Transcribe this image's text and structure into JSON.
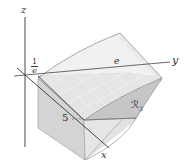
{
  "figure": {
    "type": "3d-region-diagram",
    "axes": {
      "z_label": "z",
      "y_label": "y",
      "x_label": "x"
    },
    "tick_labels": {
      "z_tick_numerator": "1",
      "z_tick_denominator": "e",
      "y_tick": "e",
      "x_tick": "5"
    },
    "region_label": "ℛ",
    "region_subscript": "3",
    "colors": {
      "axis": "#333333",
      "surface_top": "#e8e8e8",
      "surface_side": "#d9d9d9",
      "region_base": "#c8c8c8",
      "edge": "#888888",
      "grid": "#f5f5f5"
    }
  }
}
